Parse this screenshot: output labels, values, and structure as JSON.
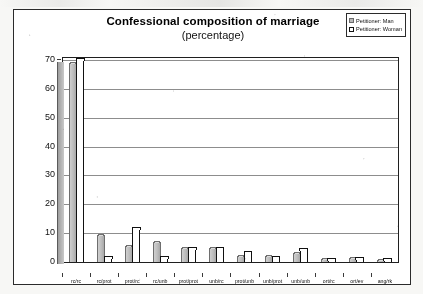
{
  "chart_data": {
    "type": "bar",
    "title": "Confessional composition of marriage",
    "subtitle": "(percentage)",
    "xlabel": "",
    "ylabel": "",
    "ylim": [
      0,
      70
    ],
    "yticks": [
      0,
      10,
      20,
      30,
      40,
      50,
      60,
      70
    ],
    "grid": true,
    "legend_position": "top-right",
    "categories": [
      "rc/rc",
      "rc/prot",
      "prot/rc",
      "rc/unb",
      "prot/prot",
      "unb/rc",
      "prot/unb",
      "unb/prot",
      "unb/unb",
      "ort/rc",
      "ort/ev",
      "ang/rk"
    ],
    "series": [
      {
        "name": "Petitioner: Man",
        "color": "#bdbdbd",
        "values": [
          69,
          9.5,
          5.5,
          7,
          5,
          5,
          2,
          2,
          3,
          1,
          1.5,
          0.7
        ]
      },
      {
        "name": "Petitioner: Woman",
        "color": "#ffffff",
        "values": [
          70,
          1.5,
          11.5,
          1.5,
          4.5,
          4.5,
          3,
          1.5,
          4,
          0.8,
          1,
          0.5
        ]
      }
    ]
  },
  "legend": {
    "items": [
      {
        "label": "Petitioner: Man"
      },
      {
        "label": "Petitioner: Woman"
      }
    ]
  }
}
